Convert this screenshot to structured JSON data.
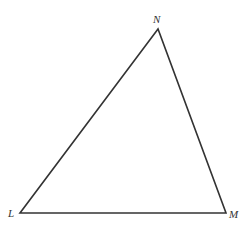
{
  "diagram": {
    "type": "triangle",
    "stroke_color": "#333333",
    "vertices": [
      {
        "label": "N",
        "x": 158,
        "y": 29
      },
      {
        "label": "L",
        "x": 20,
        "y": 213
      },
      {
        "label": "M",
        "x": 226,
        "y": 213
      }
    ]
  }
}
